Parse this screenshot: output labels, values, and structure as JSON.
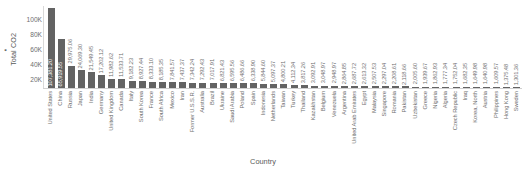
{
  "chart_data": {
    "type": "bar",
    "title": "",
    "ylabel": "Total CO2",
    "xlabel": "Country",
    "legend": [
      "Total CO2"
    ],
    "legend_position": "y-axis",
    "grid": false,
    "ylim": [
      0,
      110000
    ],
    "ytick_labels": [
      "20K",
      "40K",
      "60K",
      "80K",
      "100K"
    ],
    "ytick_values": [
      20000,
      40000,
      60000,
      80000,
      100000
    ],
    "categories": [
      "United States",
      "China",
      "Russia",
      "Japan",
      "India",
      "Germany",
      "United Kingdom",
      "Canada",
      "Italy",
      "South Korea",
      "France",
      "South Africa",
      "Mexico",
      "Iran",
      "Former U.S.S.R.",
      "Australia",
      "Brazil",
      "Ukraine",
      "Saudi Arabia",
      "Poland",
      "Spain",
      "Indonesia",
      "Netherlands",
      "Taiwan",
      "Turkey",
      "Thailand",
      "Kazakhstan",
      "Belgium",
      "Venezuela",
      "Argentina",
      "United Arab Emirates",
      "Egypt",
      "Malaysia",
      "Singapore",
      "Romania",
      "Pakistan",
      "Uzbekistan",
      "Greece",
      "Nigeria",
      "Algeria",
      "Czech Republic",
      "Iraq",
      "Korea, North",
      "Austria",
      "Philippines",
      "Hong Kong",
      "Sweden"
    ],
    "values": [
      107381.2,
      65919.55,
      29975.06,
      24069.3,
      21549.45,
      17202.12,
      11982.62,
      11533.71,
      9182.23,
      8927.44,
      8333.1,
      8185.35,
      7841.57,
      7437.37,
      7342.24,
      7292.43,
      7017.91,
      6821.43,
      6595.56,
      6486.66,
      6338.9,
      5844.6,
      5097.37,
      4800.21,
      4112.34,
      3817.26,
      3092.91,
      3048.97,
      2948.97,
      2864.85,
      2687.72,
      2613.32,
      2507.53,
      2297.04,
      2208.61,
      2118.66,
      2005.6,
      1939.67,
      1862.93,
      1777.34,
      1752.04,
      1682.35,
      1649.98,
      1640.98,
      1609.57,
      1375.48,
      1301.36
    ],
    "value_labels": [
      "107,381.20",
      "65,919.55",
      "29,975.06",
      "24,069.30",
      "21,549.45",
      "17,202.12",
      "11,982.62",
      "11,533.71",
      "9,182.23",
      "8,927.44",
      "8,333.10",
      "8,185.35",
      "7,841.57",
      "7,437.37",
      "7,342.24",
      "7,292.43",
      "7,017.91",
      "6,821.43",
      "6,595.56",
      "6,486.66",
      "6,338.90",
      "5,844.60",
      "5,097.37",
      "4,800.21",
      "4,112.34",
      "3,817.26",
      "3,092.91",
      "3,048.97",
      "2,948.97",
      "2,864.85",
      "2,687.72",
      "2,613.32",
      "2,507.53",
      "2,297.04",
      "2,208.61",
      "2,118.66",
      "2,005.60",
      "1,939.67",
      "1,862.93",
      "1,777.34",
      "1,752.04",
      "1,682.35",
      "1,649.98",
      "1,640.98",
      "1,609.57",
      "1,375.48",
      "1,301.36"
    ],
    "bar_color": "#636363",
    "label_color": "#6e6e6e",
    "inside_label_color": "#ffffff"
  }
}
